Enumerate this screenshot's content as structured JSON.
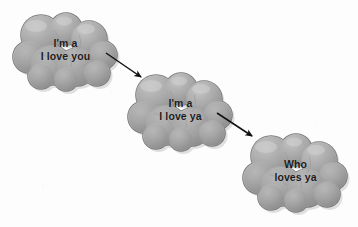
{
  "figure": {
    "type": "flow-diagram",
    "background_color": "#fdfdfd",
    "cloud_fill_color": "#a9a9a9",
    "cloud_shade_color": "#8d8d8d",
    "cloud_highlight_color": "#c4c4c4",
    "cloud_outline_color": "#6e6e6e",
    "arrow_color": "#111111",
    "text_color": "#1b1b1b"
  },
  "clouds": [
    {
      "id": "cloud-1",
      "line1": "I'm a",
      "line2": "I love you",
      "position": {
        "x": 11,
        "y": 13,
        "width": 108,
        "height": 78
      }
    },
    {
      "id": "cloud-2",
      "line1": "I'm a",
      "line2": "I love ya",
      "position": {
        "x": 126,
        "y": 73,
        "width": 108,
        "height": 78
      }
    },
    {
      "id": "cloud-3",
      "line1": "Who",
      "line2": "loves ya",
      "position": {
        "x": 241,
        "y": 134,
        "width": 108,
        "height": 78
      }
    }
  ],
  "arrows": [
    {
      "id": "arrow-1",
      "from_cloud": "cloud-1",
      "to_cloud": "cloud-2",
      "start": {
        "x": 106,
        "y": 53
      },
      "end": {
        "x": 141,
        "y": 77
      }
    },
    {
      "id": "arrow-2",
      "from_cloud": "cloud-2",
      "to_cloud": "cloud-3",
      "start": {
        "x": 217,
        "y": 113
      },
      "end": {
        "x": 252,
        "y": 136
      }
    }
  ]
}
